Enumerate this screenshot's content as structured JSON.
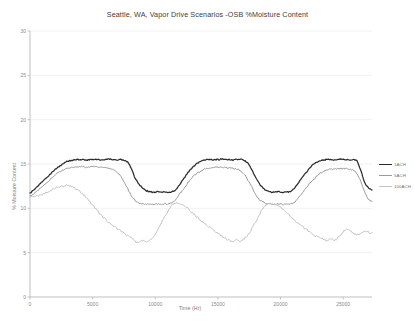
{
  "chart_data": {
    "type": "line",
    "title": "Seattle, WA, Vapor Drive Scenarios -OSB %Moisture Content",
    "xlabel": "Time (Hr)",
    "ylabel": "% Moisture Content",
    "xlim": [
      0,
      27300
    ],
    "ylim": [
      0,
      30
    ],
    "xticks": [
      0,
      5000,
      10000,
      15000,
      20000,
      25000
    ],
    "xtick_labels": [
      "0",
      "5000",
      "10000",
      "15000",
      "20000",
      "25000"
    ],
    "yticks": [
      0,
      5,
      10,
      15,
      20,
      25,
      30
    ],
    "ytick_labels": [
      "0",
      "5",
      "10",
      "15",
      "20",
      "25",
      "30"
    ],
    "grid": true,
    "grid_axis": "y",
    "legend_position": "right",
    "series": [
      {
        "name": "1ACH",
        "color": "#2b2b2b",
        "x": [
          0,
          300,
          600,
          900,
          1200,
          1500,
          1800,
          2100,
          2400,
          2700,
          3000,
          3300,
          3600,
          3900,
          4200,
          4500,
          4800,
          5100,
          5400,
          5700,
          6000,
          6300,
          6600,
          6900,
          7200,
          7500,
          7800,
          8100,
          8400,
          8700,
          9000,
          9300,
          9600,
          9900,
          10200,
          10500,
          10800,
          11100,
          11400,
          11700,
          12000,
          12300,
          12600,
          12900,
          13200,
          13500,
          13800,
          14100,
          14400,
          14700,
          15000,
          15300,
          15600,
          15900,
          16200,
          16500,
          16800,
          17100,
          17400,
          17700,
          18000,
          18300,
          18600,
          18900,
          19200,
          19500,
          19800,
          20100,
          20400,
          20700,
          21000,
          21300,
          21600,
          21900,
          22200,
          22500,
          22800,
          23100,
          23400,
          23700,
          24000,
          24300,
          24600,
          24900,
          25200,
          25500,
          25800,
          26100,
          26400,
          26700,
          27000,
          27300
        ],
        "y": [
          11.7,
          12.1,
          12.5,
          12.9,
          13.3,
          13.7,
          14.1,
          14.5,
          14.8,
          15.1,
          15.3,
          15.4,
          15.45,
          15.5,
          15.5,
          15.45,
          15.5,
          15.55,
          15.5,
          15.45,
          15.5,
          15.55,
          15.5,
          15.45,
          15.5,
          15.4,
          15.2,
          14.4,
          13.4,
          12.7,
          12.3,
          12.0,
          11.85,
          11.8,
          11.9,
          11.8,
          11.85,
          11.8,
          11.9,
          12.2,
          12.8,
          13.4,
          14.0,
          14.5,
          14.9,
          15.2,
          15.4,
          15.5,
          15.5,
          15.45,
          15.5,
          15.55,
          15.5,
          15.5,
          15.45,
          15.5,
          15.55,
          15.4,
          15.1,
          14.4,
          13.5,
          12.8,
          12.3,
          12.0,
          11.85,
          11.8,
          11.9,
          11.8,
          11.85,
          11.9,
          12.1,
          12.6,
          13.2,
          13.8,
          14.3,
          14.8,
          15.1,
          15.35,
          15.45,
          15.5,
          15.5,
          15.45,
          15.5,
          15.55,
          15.5,
          15.45,
          15.5,
          15.3,
          14.3,
          13.0,
          12.3,
          12.1
        ]
      },
      {
        "name": "5ACH",
        "color": "#9a9a9a",
        "x": [
          0,
          300,
          600,
          900,
          1200,
          1500,
          1800,
          2100,
          2400,
          2700,
          3000,
          3300,
          3600,
          3900,
          4200,
          4500,
          4800,
          5100,
          5400,
          5700,
          6000,
          6300,
          6600,
          6900,
          7200,
          7500,
          7800,
          8100,
          8400,
          8700,
          9000,
          9300,
          9600,
          9900,
          10200,
          10500,
          10800,
          11100,
          11400,
          11700,
          12000,
          12300,
          12600,
          12900,
          13200,
          13500,
          13800,
          14100,
          14400,
          14700,
          15000,
          15300,
          15600,
          15900,
          16200,
          16500,
          16800,
          17100,
          17400,
          17700,
          18000,
          18300,
          18600,
          18900,
          19200,
          19500,
          19800,
          20100,
          20400,
          20700,
          21000,
          21300,
          21600,
          21900,
          22200,
          22500,
          22800,
          23100,
          23400,
          23700,
          24000,
          24300,
          24600,
          24900,
          25200,
          25500,
          25800,
          26100,
          26400,
          26700,
          27000,
          27300
        ],
        "y": [
          11.4,
          11.7,
          12.0,
          12.35,
          12.7,
          13.1,
          13.5,
          13.85,
          14.1,
          14.35,
          14.5,
          14.6,
          14.65,
          14.7,
          14.7,
          14.65,
          14.7,
          14.7,
          14.65,
          14.6,
          14.6,
          14.55,
          14.4,
          14.1,
          13.7,
          13.0,
          12.2,
          11.4,
          10.9,
          10.6,
          10.5,
          10.45,
          10.5,
          10.45,
          10.5,
          10.45,
          10.5,
          10.5,
          10.7,
          11.1,
          11.7,
          12.3,
          12.9,
          13.4,
          13.8,
          14.1,
          14.35,
          14.5,
          14.6,
          14.6,
          14.65,
          14.65,
          14.6,
          14.55,
          14.5,
          14.4,
          14.2,
          13.8,
          13.2,
          12.4,
          11.6,
          11.0,
          10.7,
          10.55,
          10.5,
          10.45,
          10.5,
          10.45,
          10.5,
          10.5,
          10.6,
          11.0,
          11.5,
          12.0,
          12.6,
          13.1,
          13.5,
          13.9,
          14.1,
          14.3,
          14.4,
          14.45,
          14.5,
          14.5,
          14.45,
          14.4,
          14.3,
          13.9,
          13.0,
          11.9,
          11.1,
          10.8
        ]
      },
      {
        "name": "100ACH",
        "color": "#c4c4c4",
        "x": [
          0,
          300,
          600,
          900,
          1200,
          1500,
          1800,
          2100,
          2400,
          2700,
          3000,
          3300,
          3600,
          3900,
          4200,
          4500,
          4800,
          5100,
          5400,
          5700,
          6000,
          6300,
          6600,
          6900,
          7200,
          7500,
          7800,
          8100,
          8400,
          8700,
          9000,
          9300,
          9600,
          9900,
          10200,
          10500,
          10800,
          11100,
          11400,
          11700,
          12000,
          12300,
          12600,
          12900,
          13200,
          13500,
          13800,
          14100,
          14400,
          14700,
          15000,
          15300,
          15600,
          15900,
          16200,
          16500,
          16800,
          17100,
          17400,
          17700,
          18000,
          18300,
          18600,
          18900,
          19200,
          19500,
          19800,
          20100,
          20400,
          20700,
          21000,
          21300,
          21600,
          21900,
          22200,
          22500,
          22800,
          23100,
          23400,
          23700,
          24000,
          24300,
          24600,
          24900,
          25200,
          25500,
          25800,
          26100,
          26400,
          26700,
          27000,
          27300
        ],
        "y": [
          11.3,
          11.35,
          11.4,
          11.5,
          11.7,
          11.9,
          12.1,
          12.3,
          12.45,
          12.55,
          12.6,
          12.5,
          12.3,
          12.0,
          11.6,
          11.2,
          10.7,
          10.2,
          9.7,
          9.2,
          8.8,
          8.4,
          8.1,
          7.8,
          7.5,
          7.2,
          6.9,
          6.6,
          6.3,
          6.15,
          6.4,
          6.2,
          6.5,
          6.9,
          7.6,
          8.4,
          9.2,
          9.9,
          10.4,
          10.6,
          10.5,
          10.3,
          10.0,
          9.6,
          9.2,
          8.8,
          8.4,
          8.1,
          7.8,
          7.5,
          7.2,
          6.9,
          6.6,
          6.4,
          6.25,
          6.5,
          6.3,
          6.6,
          7.0,
          7.7,
          8.5,
          9.3,
          10.0,
          10.4,
          10.55,
          10.5,
          10.3,
          10.0,
          9.6,
          9.2,
          8.8,
          8.4,
          8.1,
          7.8,
          7.5,
          7.2,
          6.9,
          6.7,
          6.5,
          6.35,
          6.6,
          6.4,
          6.7,
          7.1,
          7.6,
          7.5,
          7.2,
          7.0,
          7.1,
          7.4,
          7.3,
          7.15
        ]
      }
    ]
  },
  "legend": {
    "items": [
      {
        "label": "1ACH"
      },
      {
        "label": "5ACH"
      },
      {
        "label": "100ACH"
      }
    ]
  }
}
